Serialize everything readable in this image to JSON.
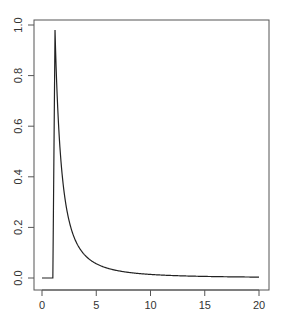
{
  "chart_data": {
    "type": "line",
    "title": "",
    "xlabel": "",
    "ylabel": "",
    "xlim": [
      -0.8,
      21
    ],
    "ylim": [
      -0.04,
      1.04
    ],
    "x_ticks": [
      "0",
      "5",
      "10",
      "15",
      "20"
    ],
    "y_ticks": [
      "0.0",
      "0.2",
      "0.4",
      "0.6",
      "0.8",
      "1.0"
    ],
    "grid": false,
    "legend": null,
    "series": [
      {
        "name": "density",
        "color": "#222222",
        "x": [
          0,
          1.0,
          1.0,
          1.2,
          1.4,
          1.6,
          1.8,
          2,
          2.5,
          3,
          3.5,
          4,
          5,
          6,
          7,
          8,
          10,
          12,
          15,
          18,
          20
        ],
        "values": [
          0,
          0,
          0,
          0.98,
          0.51,
          0.39,
          0.31,
          0.25,
          0.16,
          0.11,
          0.082,
          0.0625,
          0.04,
          0.028,
          0.02,
          0.016,
          0.01,
          0.007,
          0.0044,
          0.0031,
          0.0025
        ]
      }
    ]
  }
}
